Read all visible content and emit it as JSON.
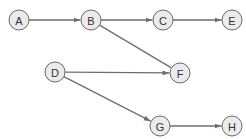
{
  "diagram": {
    "type": "directed-graph",
    "nodes": [
      {
        "id": "A",
        "label": "A",
        "x": 19,
        "y": 20
      },
      {
        "id": "B",
        "label": "B",
        "x": 91,
        "y": 20
      },
      {
        "id": "C",
        "label": "C",
        "x": 163,
        "y": 20
      },
      {
        "id": "E",
        "label": "E",
        "x": 232,
        "y": 20
      },
      {
        "id": "D",
        "label": "D",
        "x": 55,
        "y": 72
      },
      {
        "id": "F",
        "label": "F",
        "x": 180,
        "y": 73
      },
      {
        "id": "G",
        "label": "G",
        "x": 160,
        "y": 126
      },
      {
        "id": "H",
        "label": "H",
        "x": 232,
        "y": 126
      }
    ],
    "edges": [
      {
        "from": "A",
        "to": "B",
        "arrow": true
      },
      {
        "from": "B",
        "to": "C",
        "arrow": true
      },
      {
        "from": "C",
        "to": "E",
        "arrow": true
      },
      {
        "from": "B",
        "to": "F",
        "arrow": false
      },
      {
        "from": "D",
        "to": "F",
        "arrow": true
      },
      {
        "from": "D",
        "to": "G",
        "arrow": true
      },
      {
        "from": "G",
        "to": "H",
        "arrow": true
      }
    ],
    "colors": {
      "node_fill": "#ebebeb",
      "node_stroke": "#6a6a6a",
      "edge": "#6e6e6e"
    }
  }
}
